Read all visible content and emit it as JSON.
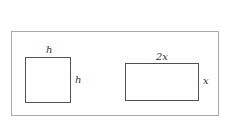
{
  "figure": {
    "square": {
      "top_label": "h",
      "side_label": "h"
    },
    "rectangle": {
      "top_label": "2x",
      "side_label": "x"
    }
  }
}
